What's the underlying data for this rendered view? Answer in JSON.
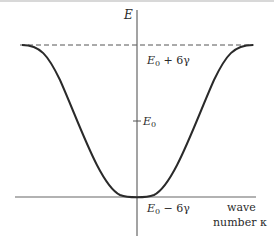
{
  "diagram": {
    "type": "energy band dispersion",
    "axis_y_label": "E",
    "axis_x_label_line1": "wave",
    "axis_x_label_line2": "number κ",
    "labels": {
      "top": {
        "base": "E",
        "sub": "0",
        "rest": " + 6γ"
      },
      "middle": {
        "base": "E",
        "sub": "0",
        "rest": ""
      },
      "bottom": {
        "base": "E",
        "sub": "0",
        "rest": " − 6γ"
      }
    },
    "curve": "E = E0 − 2γ·(1 + 2cos κa) style cosine band from E0−6γ at κ=0 to E0+6γ at zone edges",
    "colors": {
      "curve": "#2a2a2a",
      "axes": "#555555",
      "dashed": "#555555"
    }
  }
}
